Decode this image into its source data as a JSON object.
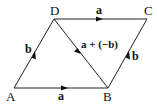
{
  "diagram": {
    "title": "",
    "vertices": {
      "A": {
        "label": "A",
        "x": 14,
        "y": 88
      },
      "B": {
        "label": "B",
        "x": 108,
        "y": 88
      },
      "C": {
        "label": "C",
        "x": 147,
        "y": 19
      },
      "D": {
        "label": "D",
        "x": 54,
        "y": 19
      }
    },
    "edges": [
      {
        "from": "A",
        "to": "B",
        "label": "a",
        "arrow": "toward B"
      },
      {
        "from": "D",
        "to": "C",
        "label": "a",
        "arrow": "toward C"
      },
      {
        "from": "A",
        "to": "D",
        "label": "b",
        "arrow": "toward D"
      },
      {
        "from": "B",
        "to": "C",
        "label": "b",
        "arrow": "toward C"
      },
      {
        "from": "D",
        "to": "B",
        "label": "a + (−b)",
        "arrow": "toward B"
      }
    ],
    "labels": {
      "A": "A",
      "B": "B",
      "C": "C",
      "D": "D",
      "ab": "a",
      "dc": "a",
      "ad": "b",
      "bc": "b",
      "db": "a + (−b)"
    },
    "line_color": "#222222",
    "background": "#ffffff"
  }
}
